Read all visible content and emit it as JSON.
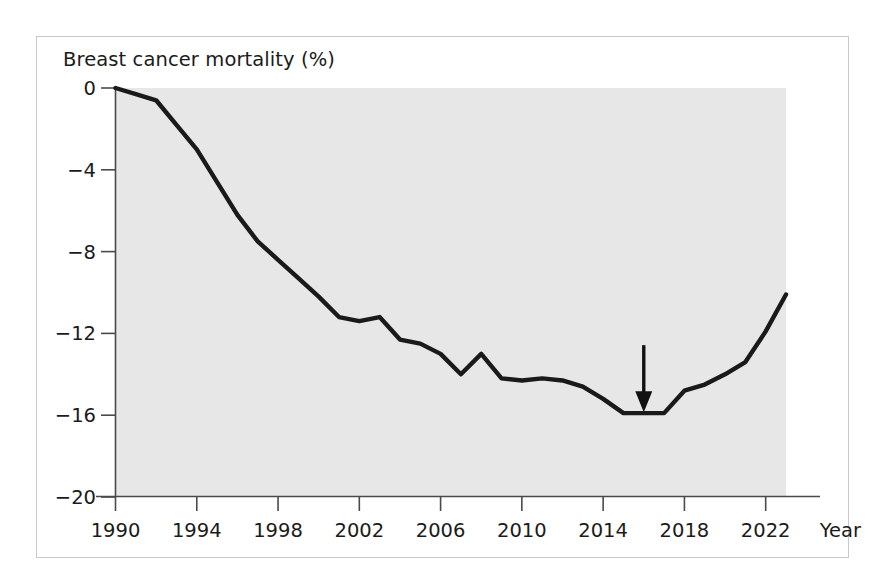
{
  "figure": {
    "title": "Breast cancer mortality (%)",
    "x_axis_name": "Year",
    "background_color": "#e7e7e7",
    "line_color": "#1a1a1a",
    "frame_color": "#c9c9c9"
  },
  "annotation": {
    "type": "down-arrow",
    "year": 2016,
    "value": -15.9,
    "label": ""
  },
  "chart_data": {
    "type": "line",
    "title": "Breast cancer mortality (%)",
    "xlabel": "Year",
    "ylabel": "Breast cancer mortality (%)",
    "xlim": [
      1990,
      2023
    ],
    "ylim": [
      -20,
      0
    ],
    "xticks": [
      1990,
      1994,
      1998,
      2002,
      2006,
      2010,
      2014,
      2018,
      2022
    ],
    "yticks": [
      0,
      -4,
      -8,
      -12,
      -16,
      -20
    ],
    "ytick_labels": [
      "0",
      "−4",
      "−8",
      "−12",
      "−16",
      "−20"
    ],
    "xtick_labels": [
      "1990",
      "1994",
      "1998",
      "2002",
      "2006",
      "2010",
      "2014",
      "2018",
      "2022"
    ],
    "grid": false,
    "legend": null,
    "annotations": [
      {
        "type": "arrow",
        "x": 2016,
        "y": -15.9,
        "direction": "down"
      }
    ],
    "series": [
      {
        "name": "Breast cancer mortality change (%)",
        "x": [
          1990,
          1991,
          1992,
          1993,
          1994,
          1995,
          1996,
          1997,
          1998,
          1999,
          2000,
          2001,
          2002,
          2003,
          2004,
          2005,
          2006,
          2007,
          2008,
          2009,
          2010,
          2011,
          2012,
          2013,
          2014,
          2015,
          2016,
          2017,
          2018,
          2019,
          2020,
          2021,
          2022,
          2023
        ],
        "values": [
          0.0,
          -0.3,
          -0.6,
          -1.8,
          -3.0,
          -4.6,
          -6.2,
          -7.5,
          -8.4,
          -9.3,
          -10.2,
          -11.2,
          -11.4,
          -11.2,
          -12.3,
          -12.5,
          -13.0,
          -14.0,
          -13.0,
          -14.2,
          -14.3,
          -14.2,
          -14.3,
          -14.6,
          -15.2,
          -15.9,
          -15.9,
          -15.9,
          -14.8,
          -14.5,
          -14.0,
          -13.4,
          -11.9,
          -10.1
        ]
      }
    ]
  }
}
